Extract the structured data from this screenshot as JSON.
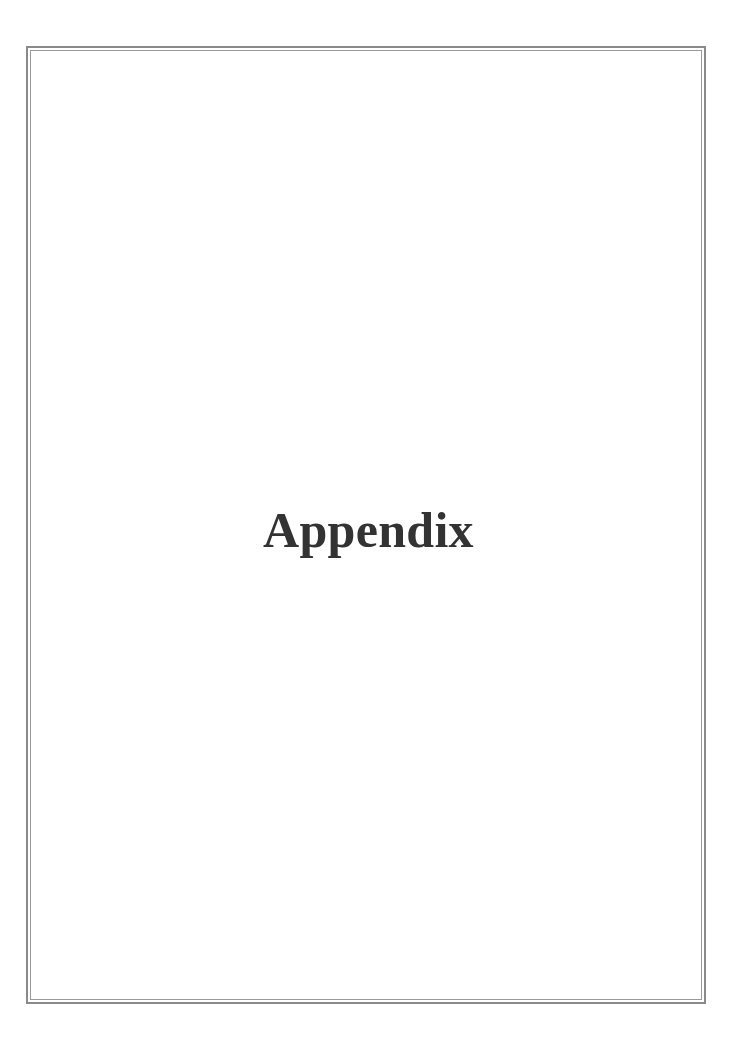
{
  "page": {
    "title": "Appendix"
  },
  "colors": {
    "border": "#8a8a8a",
    "title_text": "#333333",
    "background": "#ffffff"
  }
}
